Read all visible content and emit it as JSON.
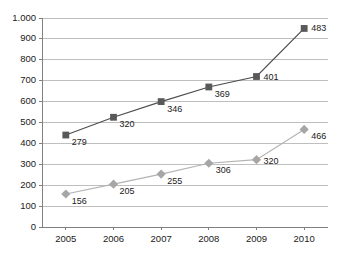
{
  "chart_data": {
    "type": "line",
    "title": "",
    "subtitle": "",
    "xlabel": "",
    "ylabel": "",
    "categories": [
      "2005",
      "2006",
      "2007",
      "2008",
      "2009",
      "2010"
    ],
    "ylim": [
      0,
      1000
    ],
    "ytick_values": [
      0,
      100,
      200,
      300,
      400,
      500,
      600,
      700,
      800,
      900,
      1000
    ],
    "ytick_labels": [
      "0",
      "100",
      "200",
      "300",
      "400",
      "500",
      "600",
      "700",
      "800",
      "900",
      "1.000"
    ],
    "grid": true,
    "grid_axis": "y",
    "legend": "none",
    "decimal_separator_style": "thousands-dot",
    "series": [
      {
        "name": "series-squares",
        "marker": "square",
        "color": "#595959",
        "line_color": "#4d4d4d",
        "plotted_values": [
          440,
          525,
          600,
          670,
          720,
          950
        ],
        "labels": [
          "279",
          "320",
          "346",
          "369",
          "401",
          "483"
        ]
      },
      {
        "name": "series-diamonds",
        "marker": "diamond",
        "color": "#a6a6a6",
        "line_color": "#b3b3b3",
        "plotted_values": [
          158,
          205,
          253,
          305,
          322,
          467
        ],
        "labels": [
          "156",
          "205",
          "255",
          "306",
          "320",
          "466"
        ]
      }
    ],
    "annotations": [
      {
        "text": "279",
        "series": 0,
        "index": 0
      },
      {
        "text": "320",
        "series": 0,
        "index": 1
      },
      {
        "text": "346",
        "series": 0,
        "index": 2
      },
      {
        "text": "369",
        "series": 0,
        "index": 3
      },
      {
        "text": "401",
        "series": 0,
        "index": 4
      },
      {
        "text": "483",
        "series": 0,
        "index": 5
      },
      {
        "text": "156",
        "series": 1,
        "index": 0
      },
      {
        "text": "205",
        "series": 1,
        "index": 1
      },
      {
        "text": "255",
        "series": 1,
        "index": 2
      },
      {
        "text": "306",
        "series": 1,
        "index": 3
      },
      {
        "text": "320",
        "series": 1,
        "index": 4
      },
      {
        "text": "466",
        "series": 1,
        "index": 5
      }
    ],
    "colors": {
      "axis": "#808080",
      "grid": "#bfbfbf",
      "background": "#ffffff",
      "text": "#1a1a1a",
      "series_dark": "#595959",
      "series_light": "#a6a6a6"
    },
    "geometry": {
      "plot_left": 42,
      "plot_right": 328,
      "plot_top": 18,
      "plot_bottom": 227
    }
  }
}
